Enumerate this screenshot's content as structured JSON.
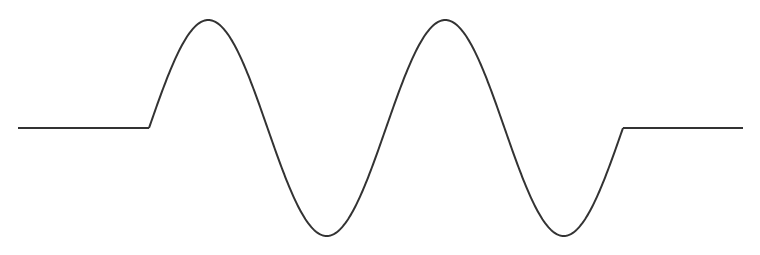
{
  "diagram": {
    "type": "waveform",
    "stroke_color": "#333333",
    "background": "#ffffff",
    "baseline_y": 128,
    "amplitude_px": 108,
    "left_flat": {
      "x_start": 18,
      "x_end": 149
    },
    "sine_segment": {
      "x_start": 149,
      "x_end": 623,
      "cycles": 2
    },
    "right_flat": {
      "x_start": 623,
      "x_end": 743
    },
    "key_points": {
      "peaks": [
        {
          "x": 209,
          "y": 20
        },
        {
          "x": 445,
          "y": 20
        }
      ],
      "troughs": [
        {
          "x": 328,
          "y": 237
        },
        {
          "x": 563,
          "y": 237
        }
      ],
      "zero_crossings_x": [
        149,
        268,
        387,
        503,
        623
      ]
    }
  }
}
